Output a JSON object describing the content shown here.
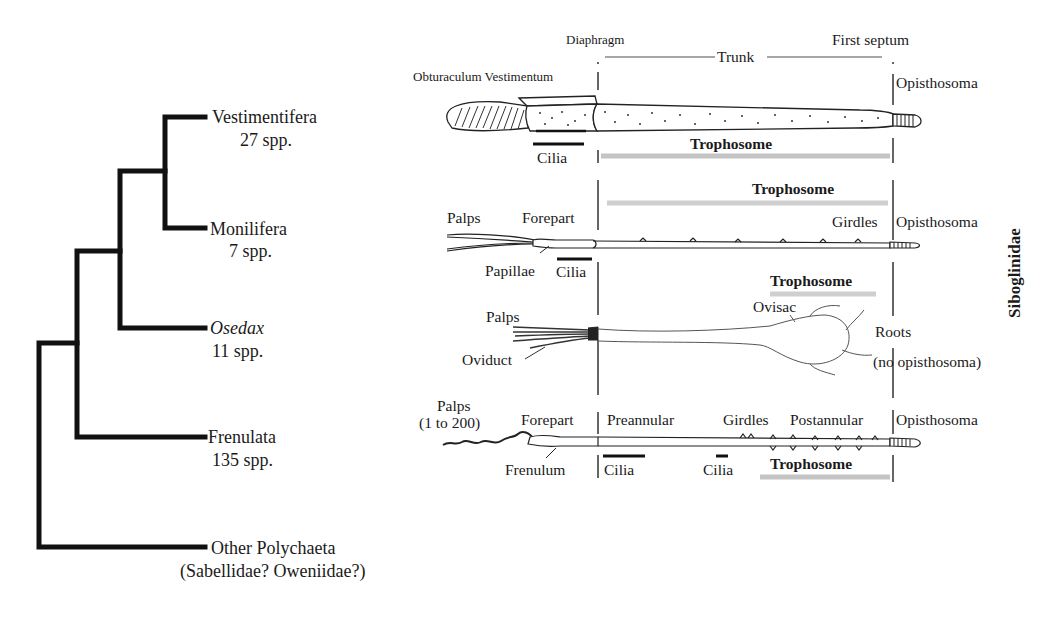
{
  "tree": {
    "taxa": [
      {
        "name": "Vestimentifera",
        "count": "27 spp.",
        "italic": false
      },
      {
        "name": "Monilifera",
        "count": "7 spp.",
        "italic": false
      },
      {
        "name": "Osedax",
        "count": "11 spp.",
        "italic": true
      },
      {
        "name": "Frenulata",
        "count": "135 spp.",
        "italic": false
      },
      {
        "name": "Other Polychaeta",
        "count": "(Sabellidae? Oweniidae?)",
        "italic": false
      }
    ],
    "line_color": "#111111"
  },
  "family_label": "Siboglinidae",
  "header": {
    "diaphragm": "Diaphragm",
    "trunk": "Trunk",
    "first_septum": "First septum"
  },
  "worms": {
    "vestimentifera": {
      "obturaculum_vestimentum": "Obturaculum Vestimentum",
      "opisthosoma": "Opisthosoma",
      "cilia": "Cilia",
      "trophosome": "Trophosome"
    },
    "monilifera": {
      "trophosome": "Trophosome",
      "palps": "Palps",
      "forepart": "Forepart",
      "girdles": "Girdles",
      "opisthosoma": "Opisthosoma",
      "papillae": "Papillae",
      "cilia": "Cilia"
    },
    "osedax": {
      "trophosome": "Trophosome",
      "palps": "Palps",
      "ovisac": "Ovisac",
      "roots": "Roots",
      "oviduct": "Oviduct",
      "no_opisthosoma": "(no opisthosoma)"
    },
    "frenulata": {
      "palps": "Palps",
      "palps_range": "(1 to 200)",
      "forepart": "Forepart",
      "preannular": "Preannular",
      "girdles": "Girdles",
      "postannular": "Postannular",
      "opisthosoma": "Opisthosoma",
      "frenulum": "Frenulum",
      "cilia_1": "Cilia",
      "cilia_2": "Cilia",
      "trophosome": "Trophosome"
    }
  },
  "colors": {
    "text": "#1a1a1a",
    "trophosome_bar": "#c4c4c4",
    "cilia_bar": "#111111",
    "divider": "#333333"
  }
}
